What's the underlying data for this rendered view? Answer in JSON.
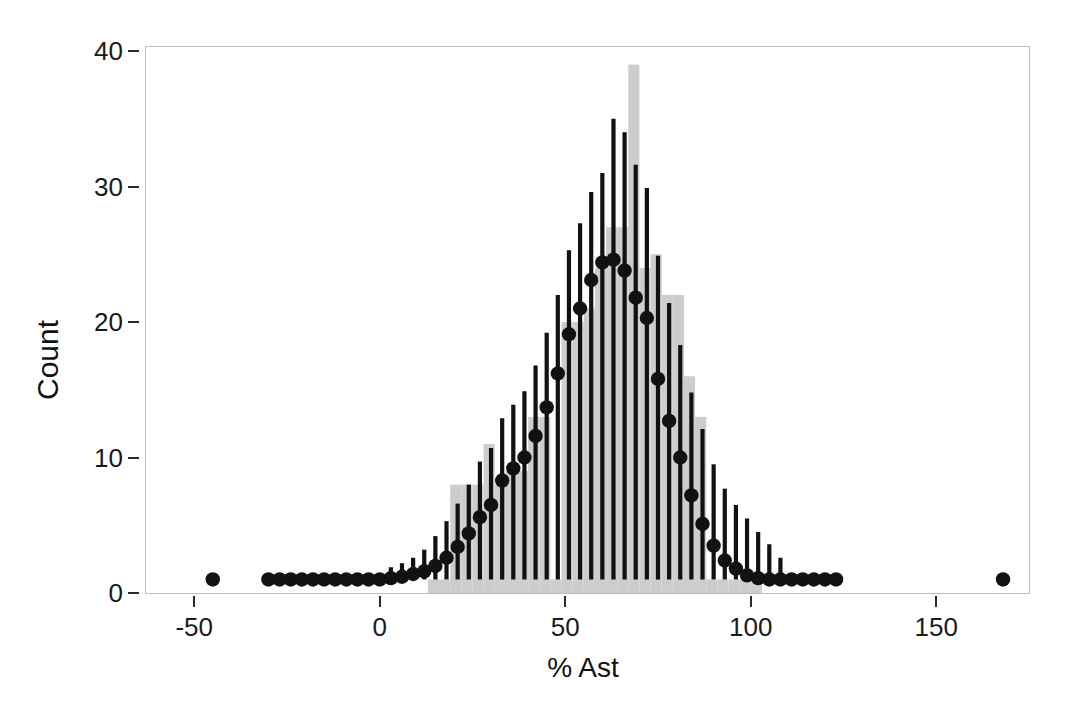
{
  "chart_data": {
    "type": "bar",
    "title": "",
    "xlabel": "% Ast",
    "ylabel": "Count",
    "xlim": [
      -63,
      175
    ],
    "ylim": [
      0,
      40.3
    ],
    "grid": false,
    "legend": null,
    "bar_color": "#cdcdcd",
    "point_color": "#111111",
    "errorbar_color": "#111111",
    "axis_color": "#2b2b2b",
    "frame_color": "#bdbdbd",
    "background": "#ffffff",
    "xticks": [
      -50,
      0,
      50,
      100,
      150
    ],
    "xticklabels": [
      "-50",
      "0",
      "50",
      "100",
      "150"
    ],
    "yticks": [
      0,
      10,
      20,
      30,
      40
    ],
    "yticklabels": [
      "0",
      "10",
      "20",
      "30",
      "40"
    ],
    "histogram": {
      "description": "Observed counts of % Ast, bin width 3",
      "bin_width": 3,
      "bin_left_edges": [
        13,
        16,
        19,
        22,
        25,
        28,
        31,
        34,
        37,
        40,
        43,
        46,
        49,
        52,
        55,
        58,
        61,
        64,
        67,
        70,
        73,
        76,
        79,
        82,
        85,
        88,
        91,
        94,
        97,
        100
      ],
      "counts": [
        1,
        1,
        8,
        8,
        8,
        11,
        8,
        9,
        9,
        13,
        13,
        1,
        20,
        20,
        21,
        24,
        27,
        27,
        39,
        24,
        25,
        22,
        22,
        16,
        13,
        1,
        1,
        1,
        1,
        1
      ]
    },
    "fitted_curve": {
      "description": "Model-predicted counts with 95% confidence interval error bars, plotted as filled circles with vertical whiskers",
      "x": [
        -45,
        -30,
        -27,
        -24,
        -21,
        -18,
        -15,
        -12,
        -9,
        -6,
        -3,
        0,
        3,
        6,
        9,
        12,
        15,
        18,
        21,
        24,
        27,
        30,
        33,
        36,
        39,
        42,
        45,
        48,
        51,
        54,
        57,
        60,
        63,
        66,
        69,
        72,
        75,
        78,
        81,
        84,
        87,
        90,
        93,
        96,
        99,
        102,
        105,
        108,
        111,
        114,
        117,
        120,
        123,
        168
      ],
      "y": [
        1.0,
        1.0,
        1.0,
        1.0,
        1.0,
        1.0,
        1.0,
        1.0,
        1.0,
        1.0,
        1.0,
        1.0,
        1.1,
        1.2,
        1.4,
        1.6,
        2.0,
        2.6,
        3.4,
        4.4,
        5.6,
        6.5,
        8.3,
        9.2,
        10.0,
        11.6,
        13.7,
        16.2,
        19.1,
        21.0,
        23.1,
        24.4,
        24.6,
        23.8,
        21.8,
        20.3,
        15.8,
        12.7,
        10.0,
        7.2,
        5.1,
        3.5,
        2.4,
        1.8,
        1.3,
        1.1,
        1.0,
        1.0,
        1.0,
        1.0,
        1.0,
        1.0,
        1.0,
        1.0
      ],
      "y_lower": [
        1.0,
        1.0,
        1.0,
        1.0,
        1.0,
        1.0,
        1.0,
        1.0,
        1.0,
        1.0,
        1.0,
        1.0,
        1.0,
        1.0,
        1.0,
        1.0,
        1.0,
        1.0,
        1.0,
        1.0,
        1.0,
        1.0,
        1.0,
        1.0,
        1.0,
        1.0,
        1.0,
        1.0,
        1.0,
        1.0,
        1.0,
        1.0,
        1.0,
        1.0,
        1.0,
        1.0,
        1.0,
        1.0,
        1.0,
        1.0,
        1.0,
        1.0,
        1.0,
        1.0,
        1.0,
        1.0,
        1.0,
        1.0,
        1.0,
        1.0,
        1.0,
        1.0,
        1.0,
        1.0
      ],
      "y_upper": [
        1.0,
        1.0,
        1.0,
        1.0,
        1.0,
        1.0,
        1.0,
        1.0,
        1.0,
        1.0,
        1.0,
        1.0,
        1.9,
        2.2,
        2.6,
        3.2,
        4.2,
        5.3,
        6.6,
        8.0,
        9.7,
        10.7,
        12.9,
        13.9,
        14.9,
        16.8,
        19.2,
        22.0,
        25.3,
        27.3,
        29.6,
        31.0,
        35.0,
        34.0,
        31.6,
        29.9,
        24.9,
        21.4,
        18.3,
        14.8,
        12.1,
        9.5,
        7.7,
        6.5,
        5.5,
        4.5,
        3.6,
        2.6,
        1.0,
        1.0,
        1.0,
        1.0,
        1.0,
        1.0
      ]
    }
  }
}
